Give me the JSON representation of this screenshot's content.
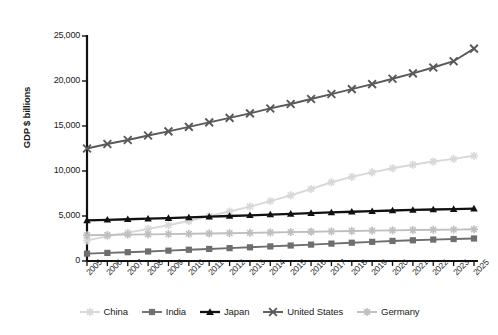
{
  "chart_data": {
    "type": "line",
    "title": "",
    "xlabel": "",
    "ylabel": "GDP $ billions",
    "ylim": [
      0,
      25000
    ],
    "yticks": [
      0,
      5000,
      10000,
      15000,
      20000,
      25000
    ],
    "ytick_labels": [
      "0",
      "5,000",
      "10,000",
      "15,000",
      "20,000",
      "25,000"
    ],
    "grid": false,
    "legend_position": "bottom",
    "categories": [
      "2005",
      "2006",
      "2007",
      "2008",
      "2009",
      "2010",
      "2011",
      "2012",
      "2013",
      "2014",
      "2015",
      "2016",
      "2017",
      "2018",
      "2019",
      "2020",
      "2021",
      "2022",
      "2023",
      "2025"
    ],
    "x": [
      2005,
      2006,
      2007,
      2008,
      2009,
      2010,
      2011,
      2012,
      2013,
      2014,
      2015,
      2016,
      2017,
      2018,
      2019,
      2020,
      2021,
      2022,
      2023,
      2025
    ],
    "series": [
      {
        "name": "China",
        "color": "#d8d8d8",
        "marker": "star",
        "values": [
          2290,
          2750,
          3160,
          3550,
          3980,
          4450,
          4980,
          5500,
          6050,
          6650,
          7300,
          8000,
          8750,
          9350,
          9850,
          10300,
          10700,
          11050,
          11350,
          11700
        ]
      },
      {
        "name": "India",
        "color": "#6e6e6e",
        "marker": "square",
        "values": [
          820,
          900,
          980,
          1060,
          1150,
          1250,
          1340,
          1430,
          1520,
          1620,
          1720,
          1820,
          1930,
          2030,
          2130,
          2230,
          2300,
          2380,
          2440,
          2500
        ]
      },
      {
        "name": "Japan",
        "color": "#111111",
        "marker": "triangle",
        "values": [
          4520,
          4580,
          4640,
          4700,
          4770,
          4840,
          4920,
          5000,
          5080,
          5160,
          5240,
          5320,
          5400,
          5470,
          5540,
          5610,
          5670,
          5720,
          5770,
          5820
        ]
      },
      {
        "name": "United States",
        "color": "#595959",
        "marker": "cross",
        "values": [
          12500,
          13000,
          13450,
          13950,
          14400,
          14900,
          15400,
          15900,
          16400,
          16950,
          17450,
          18000,
          18550,
          19100,
          19650,
          20250,
          20850,
          21500,
          22200,
          23600
        ]
      },
      {
        "name": "Germany",
        "color": "#bfbfbf",
        "marker": "asterisk",
        "values": [
          2860,
          2900,
          2930,
          2960,
          2990,
          3020,
          3060,
          3090,
          3130,
          3170,
          3210,
          3250,
          3290,
          3330,
          3370,
          3400,
          3440,
          3470,
          3490,
          3520
        ]
      }
    ]
  },
  "axis": {
    "ylabel": "GDP $ billions",
    "ytick_labels": [
      "25,000",
      "20,000",
      "15,000",
      "10,000",
      "5,000",
      "0"
    ],
    "xtick_labels": [
      "2005",
      "2006",
      "2007",
      "2008",
      "2009",
      "2010",
      "2011",
      "2012",
      "2013",
      "2014",
      "2015",
      "2016",
      "2017",
      "2018",
      "2019",
      "2020",
      "2021",
      "2022",
      "2023",
      "2025"
    ]
  },
  "legend": {
    "items": [
      {
        "label": "China",
        "color": "#d8d8d8",
        "marker": "star"
      },
      {
        "label": "India",
        "color": "#6e6e6e",
        "marker": "square"
      },
      {
        "label": "Japan",
        "color": "#111111",
        "marker": "triangle"
      },
      {
        "label": "United States",
        "color": "#595959",
        "marker": "cross"
      },
      {
        "label": "Germany",
        "color": "#bfbfbf",
        "marker": "asterisk"
      }
    ]
  }
}
